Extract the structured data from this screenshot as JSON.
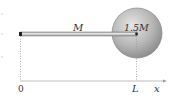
{
  "diagram": {
    "rod_label": "M",
    "disk_label": "1.5M",
    "axis": {
      "origin_label": "0",
      "end_label": "L",
      "axis_label": "x"
    }
  },
  "colors": {
    "rod_fill": "#c8c8c8",
    "disk_light": "#e2e2e2",
    "disk_dark": "#8a8a8a",
    "axis": "#bdbdbd"
  }
}
